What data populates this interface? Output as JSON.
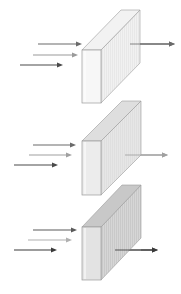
{
  "diagram": {
    "panels": [
      {
        "id": "slab-1",
        "front_fill": "#f7f7f7",
        "side_fill": "#efefef",
        "top_fill": "#f2f2f2",
        "hatch": "#dcdcdc",
        "front": [
          82,
          50,
          101,
          103
        ],
        "depth": [
          39,
          -40
        ],
        "incoming": [
          {
            "x1": 38,
            "x2": 82,
            "y": 44,
            "color": "#6a6a6a"
          },
          {
            "x1": 33,
            "x2": 78,
            "y": 55,
            "color": "#9a9a9a"
          },
          {
            "x1": 20,
            "x2": 63,
            "y": 65,
            "color": "#4a4a4a"
          }
        ],
        "outgoing": {
          "x1": 130,
          "x2": 175,
          "y": 44,
          "color": "#6a6a6a"
        }
      },
      {
        "id": "slab-2",
        "front_fill": "#ececec",
        "side_fill": "#e2e2e2",
        "top_fill": "#dedede",
        "hatch": "#d4d4d4",
        "front": [
          82,
          141,
          101,
          195
        ],
        "depth": [
          40,
          -40
        ],
        "incoming": [
          {
            "x1": 33,
            "x2": 76,
            "y": 145,
            "color": "#6a6a6a"
          },
          {
            "x1": 29,
            "x2": 72,
            "y": 155,
            "color": "#a0a0a0"
          },
          {
            "x1": 14,
            "x2": 58,
            "y": 165,
            "color": "#4a4a4a"
          }
        ],
        "outgoing": {
          "x1": 125,
          "x2": 168,
          "y": 155,
          "color": "#a0a0a0"
        }
      },
      {
        "id": "slab-3",
        "front_fill": "#e3e3e3",
        "side_fill": "#cfcfcf",
        "top_fill": "#c8c8c8",
        "hatch": "#b5b5b5",
        "front": [
          82,
          227,
          101,
          280
        ],
        "depth": [
          40,
          -42
        ],
        "incoming": [
          {
            "x1": 33,
            "x2": 77,
            "y": 230,
            "color": "#5a5a5a"
          },
          {
            "x1": 28,
            "x2": 72,
            "y": 240,
            "color": "#b0b0b0"
          },
          {
            "x1": 14,
            "x2": 57,
            "y": 250,
            "color": "#3a3a3a"
          }
        ],
        "outgoing": {
          "x1": 115,
          "x2": 158,
          "y": 250,
          "color": "#3a3a3a"
        }
      }
    ],
    "edge_color": "#9a9a9a"
  }
}
